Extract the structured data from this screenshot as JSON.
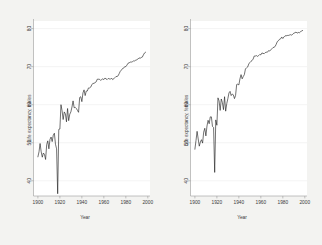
{
  "figure": {
    "background_color": "#f3f3f1",
    "plot_background_color": "#ffffff",
    "line_color": "#1a1a1a",
    "axis_color": "#9a9a9a",
    "grid_color": "#e8e8e8",
    "text_color": "#3a3a3a"
  },
  "chart_data": [
    {
      "type": "line",
      "panel": "left",
      "title": "",
      "xlabel": "Year",
      "ylabel": "Life expectancy, males",
      "xlim": [
        1896,
        2002
      ],
      "ylim": [
        36,
        82
      ],
      "xticks": [
        1900,
        1920,
        1940,
        1960,
        1980,
        2000
      ],
      "xticklabels": [
        "1900",
        "1920",
        "1940",
        "1960",
        "1980",
        "2000"
      ],
      "yticks": [
        40,
        50,
        60,
        70,
        80
      ],
      "yticklabels": [
        "40",
        "50",
        "60",
        "70",
        "80"
      ],
      "grid": true,
      "legend": null,
      "series": [
        {
          "name": "Life expectancy, males",
          "x": [
            1900,
            1901,
            1902,
            1903,
            1904,
            1905,
            1906,
            1907,
            1908,
            1909,
            1910,
            1911,
            1912,
            1913,
            1914,
            1915,
            1916,
            1917,
            1918,
            1919,
            1920,
            1921,
            1922,
            1923,
            1924,
            1925,
            1926,
            1927,
            1928,
            1929,
            1930,
            1931,
            1932,
            1933,
            1934,
            1935,
            1936,
            1937,
            1938,
            1939,
            1940,
            1941,
            1942,
            1943,
            1944,
            1945,
            1946,
            1947,
            1948,
            1949,
            1950,
            1951,
            1952,
            1953,
            1954,
            1955,
            1956,
            1957,
            1958,
            1959,
            1960,
            1961,
            1962,
            1963,
            1964,
            1965,
            1966,
            1967,
            1968,
            1969,
            1970,
            1971,
            1972,
            1973,
            1974,
            1975,
            1976,
            1977,
            1978,
            1979,
            1980,
            1981,
            1982,
            1983,
            1984,
            1985,
            1986,
            1987,
            1988,
            1989,
            1990,
            1991,
            1992,
            1993,
            1994,
            1995,
            1996,
            1997,
            1998
          ],
          "values": [
            46.3,
            47.6,
            49.8,
            47.6,
            46.2,
            47.3,
            46.9,
            45.6,
            49.5,
            50.5,
            48.4,
            50.9,
            51.5,
            50.3,
            52.0,
            52.5,
            49.6,
            48.4,
            36.6,
            53.5,
            53.6,
            60.0,
            58.4,
            56.1,
            58.1,
            57.6,
            55.5,
            59.0,
            55.8,
            57.5,
            58.1,
            59.4,
            61.0,
            59.2,
            59.3,
            59.0,
            58.5,
            58.0,
            61.9,
            62.1,
            60.8,
            63.1,
            63.9,
            62.4,
            63.6,
            63.6,
            64.4,
            64.4,
            64.6,
            65.2,
            65.6,
            65.6,
            65.8,
            66.0,
            66.7,
            66.7,
            66.7,
            66.4,
            66.6,
            66.8,
            66.6,
            67.0,
            66.8,
            66.6,
            66.9,
            66.8,
            66.7,
            67.0,
            66.6,
            66.8,
            67.1,
            67.4,
            67.4,
            67.6,
            68.2,
            68.8,
            69.1,
            69.5,
            69.6,
            70.0,
            70.0,
            70.4,
            70.9,
            71.0,
            71.2,
            71.2,
            71.3,
            71.5,
            71.5,
            71.7,
            71.8,
            72.0,
            72.3,
            72.2,
            72.4,
            72.5,
            73.1,
            73.6,
            73.8
          ]
        }
      ]
    },
    {
      "type": "line",
      "panel": "right",
      "title": "",
      "xlabel": "Year",
      "ylabel": "Life expectancy, females",
      "xlim": [
        1896,
        2002
      ],
      "ylim": [
        36,
        82
      ],
      "xticks": [
        1900,
        1920,
        1940,
        1960,
        1980,
        2000
      ],
      "xticklabels": [
        "1900",
        "1920",
        "1940",
        "1960",
        "1980",
        "2000"
      ],
      "yticks": [
        40,
        50,
        60,
        70,
        80
      ],
      "yticklabels": [
        "40",
        "50",
        "60",
        "70",
        "80"
      ],
      "grid": true,
      "legend": null,
      "series": [
        {
          "name": "Life expectancy, females",
          "x": [
            1900,
            1901,
            1902,
            1903,
            1904,
            1905,
            1906,
            1907,
            1908,
            1909,
            1910,
            1911,
            1912,
            1913,
            1914,
            1915,
            1916,
            1917,
            1918,
            1919,
            1920,
            1921,
            1922,
            1923,
            1924,
            1925,
            1926,
            1927,
            1928,
            1929,
            1930,
            1931,
            1932,
            1933,
            1934,
            1935,
            1936,
            1937,
            1938,
            1939,
            1940,
            1941,
            1942,
            1943,
            1944,
            1945,
            1946,
            1947,
            1948,
            1949,
            1950,
            1951,
            1952,
            1953,
            1954,
            1955,
            1956,
            1957,
            1958,
            1959,
            1960,
            1961,
            1962,
            1963,
            1964,
            1965,
            1966,
            1967,
            1968,
            1969,
            1970,
            1971,
            1972,
            1973,
            1974,
            1975,
            1976,
            1977,
            1978,
            1979,
            1980,
            1981,
            1982,
            1983,
            1984,
            1985,
            1986,
            1987,
            1988,
            1989,
            1990,
            1991,
            1992,
            1993,
            1994,
            1995,
            1996,
            1997,
            1998
          ],
          "values": [
            48.3,
            50.6,
            53.0,
            51.0,
            49.1,
            50.2,
            50.8,
            49.9,
            52.8,
            53.8,
            51.8,
            54.4,
            55.9,
            55.0,
            56.8,
            56.8,
            54.3,
            54.0,
            42.2,
            56.0,
            54.6,
            61.8,
            61.0,
            58.5,
            61.5,
            60.6,
            58.7,
            62.1,
            58.3,
            60.3,
            61.6,
            63.1,
            63.5,
            62.4,
            62.8,
            62.6,
            61.6,
            62.4,
            65.3,
            65.4,
            65.2,
            66.8,
            67.9,
            66.8,
            67.4,
            67.9,
            69.4,
            69.7,
            69.9,
            70.7,
            71.1,
            71.4,
            71.6,
            72.0,
            72.8,
            72.8,
            72.9,
            72.7,
            72.9,
            73.2,
            73.1,
            73.6,
            73.5,
            73.4,
            73.7,
            73.8,
            73.8,
            74.2,
            74.1,
            74.4,
            74.7,
            75.0,
            75.1,
            75.3,
            75.9,
            76.6,
            76.8,
            77.2,
            77.3,
            77.8,
            77.4,
            77.8,
            78.1,
            78.1,
            78.2,
            78.2,
            78.3,
            78.4,
            78.3,
            78.5,
            78.8,
            78.9,
            79.1,
            78.8,
            79.0,
            78.9,
            79.1,
            79.4,
            79.5
          ]
        }
      ]
    }
  ]
}
